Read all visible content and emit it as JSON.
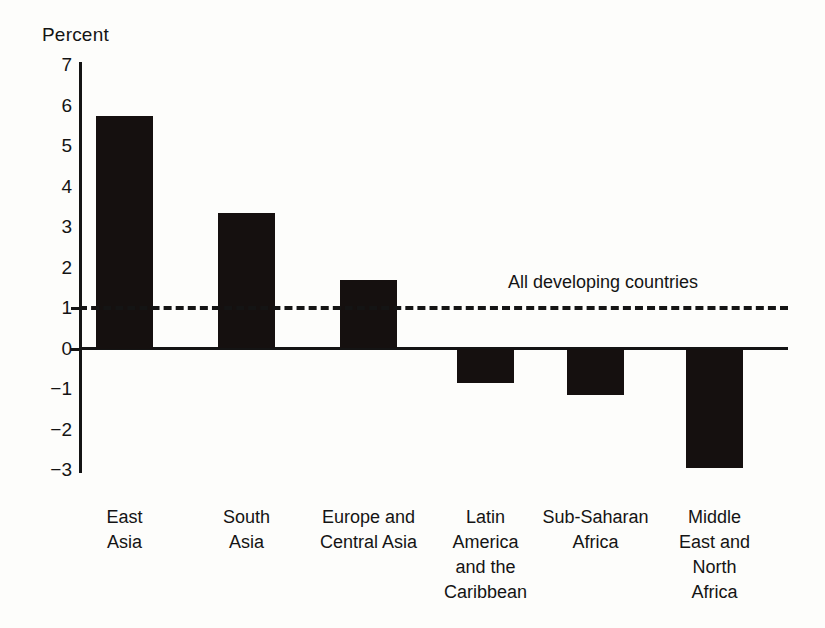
{
  "chart_data": {
    "type": "bar",
    "title": "",
    "ylabel": "Percent",
    "xlabel": "",
    "categories": [
      "East Asia",
      "South Asia",
      "Europe and Central Asia",
      "Latin America and the Caribbean",
      "Sub-Saharan Africa",
      "Middle East and North Africa"
    ],
    "category_lines": [
      [
        "East",
        "Asia"
      ],
      [
        "South",
        "Asia"
      ],
      [
        "Europe and",
        "Central Asia"
      ],
      [
        "Latin",
        "America",
        "and the",
        "Caribbean"
      ],
      [
        "Sub-Saharan",
        "Africa"
      ],
      [
        "Middle",
        "East and",
        "North",
        "Africa"
      ]
    ],
    "values": [
      5.75,
      3.35,
      1.7,
      -0.85,
      -1.15,
      -2.95
    ],
    "ylim": [
      -3,
      7
    ],
    "yticks": [
      7,
      6,
      5,
      4,
      3,
      2,
      1,
      0,
      -1,
      -2,
      -3
    ],
    "ytick_labels": [
      "7",
      "6",
      "5",
      "4",
      "3",
      "2",
      "1",
      "0",
      "−1",
      "−2",
      "−3"
    ],
    "grid": false,
    "legend": "none",
    "bar_color": "#15100f",
    "axis_color": "#141414",
    "background_color": "#fdfdfb",
    "reference_line": {
      "label": "All developing countries",
      "value": 1.05,
      "style": "dashed"
    }
  }
}
